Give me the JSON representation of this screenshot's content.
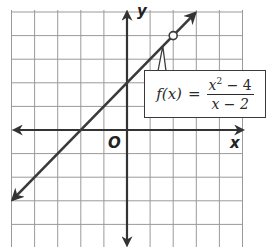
{
  "chart_data": {
    "type": "line",
    "title": "",
    "function_label": "f(x) = (x^2 - 4)/(x - 2)",
    "simplified": "y = x + 2, x ≠ 2",
    "xlabel": "x",
    "ylabel": "y",
    "origin_label": "O",
    "xlim": [
      -5,
      5
    ],
    "ylim": [
      -5,
      5
    ],
    "grid": true,
    "grid_step": 1,
    "series": [
      {
        "name": "f(x)",
        "x": [
          -5,
          -4,
          -3,
          -2,
          -1,
          0,
          1,
          2,
          3
        ],
        "y": [
          -3,
          -2,
          -1,
          0,
          1,
          2,
          3,
          4,
          5
        ],
        "arrows": "both"
      }
    ],
    "open_points": [
      {
        "x": 2,
        "y": 4,
        "note": "hole (undefined at x = 2)"
      }
    ]
  },
  "labels": {
    "x_axis": "x",
    "y_axis": "y",
    "origin": "O",
    "func_lhs": "f(x)",
    "func_eq": "=",
    "num_base": "x",
    "num_exp": "2",
    "num_rest": " − 4",
    "den": "x − 2"
  },
  "colors": {
    "grid": "#9a9a9a",
    "axis": "#333333",
    "line": "#3a3a3a"
  }
}
